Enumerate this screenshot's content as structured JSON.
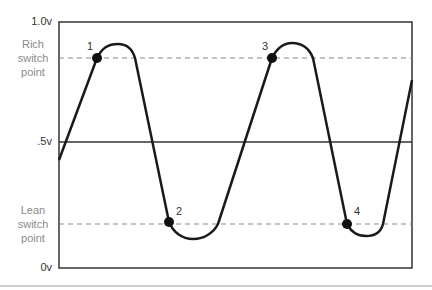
{
  "diagram": {
    "type": "oxygen-sensor-voltage-waveform",
    "y_axis": {
      "labels": {
        "top": "1.0v",
        "mid": ".5v",
        "bottom": "0v"
      },
      "range": [
        0,
        1.0
      ]
    },
    "switch_points": {
      "rich": {
        "label_line1": "Rich",
        "label_line2": "switch",
        "label_line3": "point",
        "voltage": 0.85
      },
      "lean": {
        "label_line1": "Lean",
        "label_line2": "switch",
        "label_line3": "point",
        "voltage": 0.18
      }
    },
    "points": [
      {
        "label": "1",
        "type": "rich"
      },
      {
        "label": "2",
        "type": "lean"
      },
      {
        "label": "3",
        "type": "rich"
      },
      {
        "label": "4",
        "type": "lean"
      }
    ],
    "colors": {
      "waveform": "#1a1a1a",
      "axis": "#333333",
      "dashed": "#8a8a8a",
      "label_gray": "#8a8a8a"
    }
  }
}
